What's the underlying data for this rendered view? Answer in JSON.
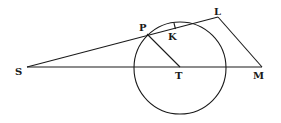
{
  "diagram": {
    "title": "",
    "type": "geometric-figure",
    "colors": {
      "ink": "#1a1a1a",
      "background": "#ffffff"
    },
    "circle": {
      "center": "T",
      "cx": 180,
      "cy": 68,
      "r": 46
    },
    "points": {
      "S": {
        "label": "S",
        "x": 27,
        "y": 67
      },
      "P": {
        "label": "P",
        "x": 147,
        "y": 34
      },
      "K": {
        "label": "K",
        "x": 175,
        "y": 26
      },
      "L": {
        "label": "L",
        "x": 218,
        "y": 17
      },
      "T": {
        "label": "T",
        "x": 180,
        "y": 67
      },
      "M": {
        "label": "M",
        "x": 262,
        "y": 67
      }
    },
    "segments": [
      {
        "from": "S",
        "to": "L"
      },
      {
        "from": "S",
        "to": "M"
      },
      {
        "from": "P",
        "to": "T"
      },
      {
        "from": "L",
        "to": "M"
      }
    ],
    "labels": {
      "S": "S",
      "P": "P",
      "K": "K",
      "L": "L",
      "T": "T",
      "M": "M"
    }
  }
}
